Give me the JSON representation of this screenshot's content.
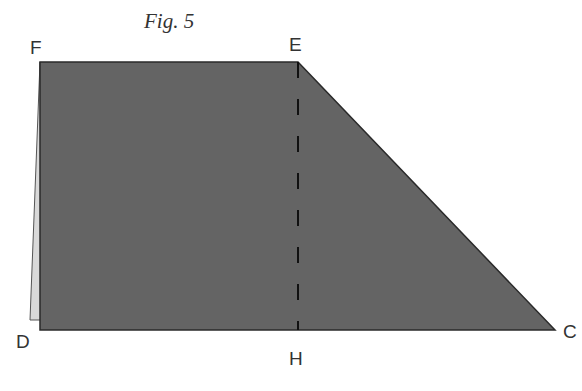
{
  "figure": {
    "title": "Fig. 5",
    "colors": {
      "fill": "#646464",
      "stroke": "#2a2a2a",
      "sliver": "#d9d9d9",
      "dash": "#111111",
      "label": "#333333"
    },
    "points": {
      "F": "F",
      "E": "E",
      "C": "C",
      "D": "D",
      "H": "H"
    },
    "segments": {
      "EH": "dashed fold line"
    }
  }
}
